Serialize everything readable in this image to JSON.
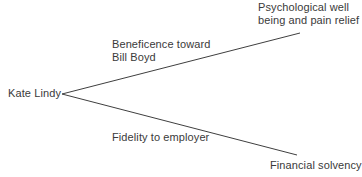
{
  "diagram": {
    "type": "fork",
    "background_color": "#ffffff",
    "line_color": "#3f3f3f",
    "text_color": "#3a3a3a",
    "source": {
      "label": "Kate Lindy"
    },
    "branches": [
      {
        "id": "upper",
        "relation_label": "Beneficence toward\nBill Boyd",
        "outcome_label": "Psychological well\nbeing and pain relief",
        "from": {
          "x": 62,
          "y": 94
        },
        "to": {
          "x": 300,
          "y": 33
        }
      },
      {
        "id": "lower",
        "relation_label": "Fidelity to employer",
        "outcome_label": "Financial solvency",
        "from": {
          "x": 62,
          "y": 94
        },
        "to": {
          "x": 297,
          "y": 155
        }
      }
    ]
  }
}
